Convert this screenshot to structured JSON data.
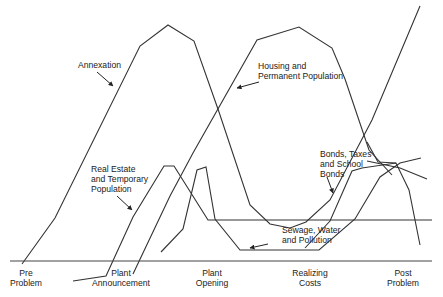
{
  "figure": {
    "type": "conceptual timeline diagram",
    "curves": [
      {
        "id": "annexation",
        "label_lines": [
          "Annexation"
        ],
        "label_pos": [
          78,
          68
        ],
        "arrow": {
          "from": [
            97,
            72
          ],
          "to": [
            113,
            86
          ]
        },
        "points": [
          [
            22,
            264
          ],
          [
            55,
            218
          ],
          [
            140,
            46
          ],
          [
            168,
            25
          ],
          [
            194,
            41
          ],
          [
            219,
            112
          ],
          [
            250,
            205
          ],
          [
            270,
            224
          ],
          [
            290,
            228
          ],
          [
            306,
            222
          ],
          [
            330,
            200
          ],
          [
            372,
            120
          ],
          [
            420,
            6
          ]
        ]
      },
      {
        "id": "housing",
        "label_lines": [
          "Housing and",
          "Permanent Population"
        ],
        "label_pos": [
          258,
          69
        ],
        "arrow": {
          "from": [
            259,
            82
          ],
          "to": [
            237,
            88
          ]
        },
        "points": [
          [
            133,
            274
          ],
          [
            170,
            196
          ],
          [
            193,
            153
          ],
          [
            257,
            40
          ],
          [
            299,
            27
          ],
          [
            332,
            48
          ],
          [
            345,
            79
          ],
          [
            369,
            150
          ],
          [
            392,
            175
          ]
        ]
      },
      {
        "id": "real-estate",
        "label_lines": [
          "Real Estate",
          "and Temporary",
          "Population"
        ],
        "label_pos": [
          91,
          172
        ],
        "arrow": {
          "from": [
            117,
            196
          ],
          "to": [
            132,
            210
          ]
        },
        "points": [
          [
            73,
            281
          ],
          [
            106,
            276
          ],
          [
            133,
            217
          ],
          [
            164,
            166
          ],
          [
            174,
            166
          ],
          [
            208,
            220
          ],
          [
            259,
            220
          ],
          [
            432,
            220
          ]
        ]
      },
      {
        "id": "sewage",
        "label_lines": [
          "Sewage, Water",
          "and Pollution"
        ],
        "label_pos": [
          282,
          233
        ],
        "arrow": {
          "from": [
            268,
            244
          ],
          "to": [
            250,
            248
          ]
        },
        "points": [
          [
            161,
            252
          ],
          [
            183,
            229
          ],
          [
            197,
            170
          ],
          [
            206,
            167
          ],
          [
            215,
            219
          ],
          [
            240,
            250
          ],
          [
            319,
            250
          ],
          [
            355,
            219
          ],
          [
            380,
            177
          ],
          [
            400,
            163
          ],
          [
            421,
            158
          ]
        ]
      },
      {
        "id": "bonds",
        "label_lines": [
          "Bonds, Taxes",
          "and School",
          "Bonds"
        ],
        "label_pos": [
          320,
          157
        ],
        "arrow": {
          "from": [
            327,
            177
          ],
          "to": [
            333,
            193
          ]
        },
        "points": [
          [
            305,
            248
          ],
          [
            330,
            221
          ],
          [
            352,
            171
          ],
          [
            362,
            168
          ],
          [
            396,
            163
          ],
          [
            409,
            190
          ],
          [
            420,
            245
          ]
        ]
      },
      {
        "id": "bonds-extra",
        "label_lines": [],
        "points": [
          [
            367,
            142
          ],
          [
            378,
            162
          ],
          [
            396,
            163
          ]
        ]
      },
      {
        "id": "post-decline",
        "label_lines": [],
        "points": [
          [
            367,
            161
          ],
          [
            400,
            168
          ],
          [
            427,
            179
          ]
        ]
      }
    ],
    "axis": {
      "y": 261,
      "x_start": 10,
      "x_end": 432
    },
    "x_labels": [
      {
        "lines": [
          "Pre",
          "Problem"
        ],
        "x": 26
      },
      {
        "lines": [
          "Plant",
          "Announcement"
        ],
        "x": 121
      },
      {
        "lines": [
          "Plant",
          "Opening"
        ],
        "x": 212
      },
      {
        "lines": [
          "Realizing",
          "Costs"
        ],
        "x": 310
      },
      {
        "lines": [
          "Post",
          "Problem"
        ],
        "x": 403
      }
    ]
  }
}
